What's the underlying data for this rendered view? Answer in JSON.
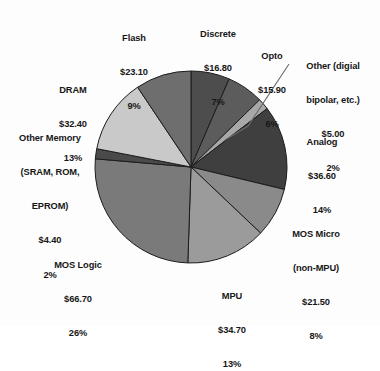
{
  "chart_data": {
    "type": "pie",
    "title": "",
    "subtitle": "",
    "units": "US$ billions",
    "legend_position": "none",
    "grid": false,
    "start_angle_deg": 0,
    "direction": "clockwise",
    "center": {
      "x": 191,
      "y": 167
    },
    "radius": 96,
    "categories": [
      "Discrete",
      "Opto",
      "Other (digial bipolar, etc.)",
      "Analog",
      "MOS Micro (non-MPU)",
      "MPU",
      "MOS Logic",
      "Other Memory (SRAM, ROM, EPROM)",
      "DRAM",
      "Flash"
    ],
    "values": [
      16.8,
      15.9,
      5.0,
      36.6,
      21.5,
      34.7,
      66.7,
      4.4,
      32.4,
      23.1
    ],
    "percents": [
      7,
      6,
      2,
      14,
      8,
      13,
      26,
      2,
      13,
      9
    ],
    "colors": [
      "#4d4d4d",
      "#5c5c5c",
      "#a8a8a8",
      "#3f3f3f",
      "#8a8a8a",
      "#9b9b9b",
      "#7a7a7a",
      "#4a4a4a",
      "#c9c9c9",
      "#6e6e6e"
    ],
    "slices": [
      {
        "name": "Discrete",
        "value": 16.8,
        "percent": 7,
        "color": "#4d4d4d",
        "start_deg": 0.0,
        "end_deg": 23.4
      },
      {
        "name": "Opto",
        "value": 15.9,
        "percent": 6,
        "color": "#5c5c5c",
        "start_deg": 23.4,
        "end_deg": 45.6
      },
      {
        "name": "Other (digial bipolar, etc.)",
        "value": 5.0,
        "percent": 2,
        "color": "#a8a8a8",
        "start_deg": 45.6,
        "end_deg": 52.5
      },
      {
        "name": "Analog",
        "value": 36.6,
        "percent": 14,
        "color": "#3f3f3f",
        "start_deg": 52.5,
        "end_deg": 103.5
      },
      {
        "name": "MOS Micro (non-MPU)",
        "value": 21.5,
        "percent": 8,
        "color": "#8a8a8a",
        "start_deg": 103.5,
        "end_deg": 133.5
      },
      {
        "name": "MPU",
        "value": 34.7,
        "percent": 13,
        "color": "#9b9b9b",
        "start_deg": 133.5,
        "end_deg": 181.9
      },
      {
        "name": "MOS Logic",
        "value": 66.7,
        "percent": 26,
        "color": "#7a7a7a",
        "start_deg": 181.9,
        "end_deg": 274.9
      },
      {
        "name": "Other Memory (SRAM, ROM, EPROM)",
        "value": 4.4,
        "percent": 2,
        "color": "#4a4a4a",
        "start_deg": 274.9,
        "end_deg": 281.0
      },
      {
        "name": "DRAM",
        "value": 32.4,
        "percent": 13,
        "color": "#c9c9c9",
        "start_deg": 281.0,
        "end_deg": 326.2
      },
      {
        "name": "Flash",
        "value": 23.1,
        "percent": 9,
        "color": "#6e6e6e",
        "start_deg": 326.2,
        "end_deg": 360.0
      }
    ]
  },
  "labels": {
    "flash": {
      "name": "Flash",
      "value": "$23.10",
      "percent": "9%"
    },
    "discrete": {
      "name": "Discrete",
      "value": "$16.80",
      "percent": "7%"
    },
    "opto": {
      "name": "Opto",
      "value": "$15.90",
      "percent": "6%"
    },
    "other_digital": {
      "name_line1": "Other (digial",
      "name_line2": "bipolar, etc.)",
      "value": "$5.00",
      "percent": "2%"
    },
    "analog": {
      "name": "Analog",
      "value": "$36.60",
      "percent": "14%"
    },
    "mos_micro": {
      "name_line1": "MOS Micro",
      "name_line2": "(non-MPU)",
      "value": "$21.50",
      "percent": "8%"
    },
    "mpu": {
      "name": "MPU",
      "value": "$34.70",
      "percent": "13%"
    },
    "mos_logic": {
      "name": "MOS Logic",
      "value": "$66.70",
      "percent": "26%"
    },
    "other_memory": {
      "name_line1": "Other Memory",
      "name_line2": "(SRAM, ROM,",
      "name_line3": "EPROM)",
      "value": "$4.40",
      "percent": "2%"
    },
    "dram": {
      "name": "DRAM",
      "value": "$32.40",
      "percent": "13%"
    }
  },
  "style": {
    "background": "#fdfdfd",
    "text_color": "#171717",
    "leader_line_color": "#6b6b6b",
    "slice_border_color": "#1c1c1c"
  }
}
